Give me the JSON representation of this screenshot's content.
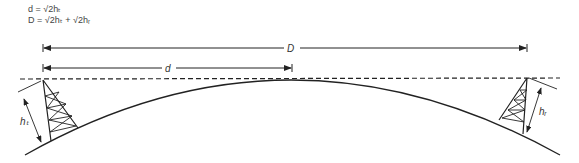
{
  "formulas": {
    "line1": "d = √2hₜ",
    "line2": "D = √2hₜ + √2hᵣ"
  },
  "labels": {
    "D": "D",
    "d": "d",
    "ht": "hₜ",
    "hr": "hᵣ"
  },
  "colors": {
    "stroke": "#222222"
  }
}
